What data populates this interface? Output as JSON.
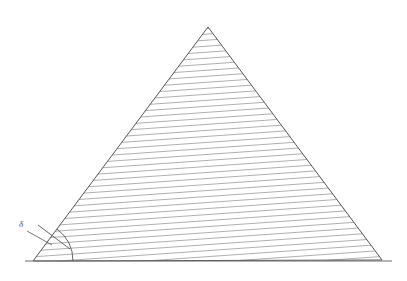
{
  "figure": {
    "canvas": {
      "width": 407,
      "height": 281,
      "background": "#ffffff"
    },
    "colors": {
      "outline": "#555555",
      "hatch": "#9a9a9a",
      "baseline": "#6b6b6b",
      "arc": "#555555",
      "leader": "#555555",
      "label": "#4a4a4a"
    },
    "triangle": {
      "name": "hatched-triangle",
      "vertices": {
        "apex": {
          "x": 208,
          "y": 27
        },
        "bottom_left": {
          "x": 33,
          "y": 261
        },
        "bottom_right": {
          "x": 382,
          "y": 260
        }
      },
      "outline_width": 1
    },
    "baseline": {
      "name": "base-line",
      "x1": 25,
      "y1": 261,
      "x2": 392,
      "y2": 261,
      "width": 1.2
    },
    "hatching": {
      "name": "hatch-fill",
      "orientation": "near-horizontal",
      "angle_degrees": 4,
      "spacing_px": 6,
      "line_width": 0.8
    },
    "angle_marker": {
      "name": "angle-arc",
      "vertex": {
        "x": 33,
        "y": 261
      },
      "radius": 40,
      "start_degrees": 0,
      "end_degrees": 53,
      "tick": {
        "name": "angle-tick-mark",
        "x1": 38,
        "y1": 225,
        "x2": 70,
        "y2": 249
      }
    },
    "angle_label": {
      "name": "angle-label-delta",
      "text": "δ",
      "x": 21,
      "y": 227,
      "leader": {
        "x1": 27,
        "y1": 231,
        "x2": 52,
        "y2": 245
      }
    }
  },
  "chart_data": {
    "type": "diagram",
    "shapes": [
      {
        "kind": "triangle",
        "label": "hatched-triangle",
        "points": [
          [
            33,
            261
          ],
          [
            208,
            27
          ],
          [
            382,
            260
          ]
        ],
        "fill": "hatched",
        "stroke": "#555555"
      },
      {
        "kind": "line",
        "label": "base-line",
        "points": [
          [
            25,
            261
          ],
          [
            392,
            261
          ]
        ],
        "stroke": "#6b6b6b"
      },
      {
        "kind": "arc",
        "label": "angle-arc",
        "center": [
          33,
          261
        ],
        "radius": 40,
        "start_degrees": 0,
        "end_degrees": 53
      }
    ],
    "annotations": [
      {
        "text": "δ",
        "x": 21,
        "y": 227,
        "describes": "base angle at bottom-left vertex"
      }
    ]
  }
}
